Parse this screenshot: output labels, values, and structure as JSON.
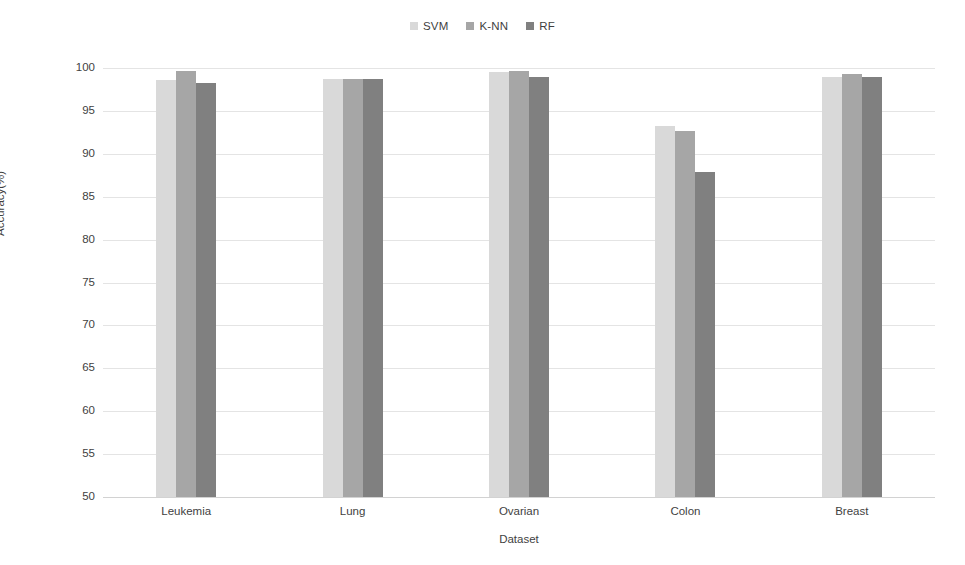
{
  "chart_data": {
    "type": "bar",
    "title": "",
    "subtitle": "",
    "xlabel": "Dataset",
    "ylabel": "Accuracy(%)",
    "categories": [
      "Leukemia",
      "Lung",
      "Ovarian",
      "Colon",
      "Breast"
    ],
    "series": [
      {
        "name": "SVM",
        "color": "#d9d9d9",
        "values": [
          98.6,
          98.7,
          99.5,
          93.2,
          99.0
        ]
      },
      {
        "name": "K-NN",
        "color": "#a6a6a6",
        "values": [
          99.6,
          98.7,
          99.6,
          92.7,
          99.3
        ]
      },
      {
        "name": "RF",
        "color": "#808080",
        "values": [
          98.3,
          98.7,
          99.0,
          87.9,
          98.9
        ]
      }
    ],
    "ylim": [
      50,
      100
    ],
    "ytick_step": 5,
    "yticks": [
      100,
      95,
      90,
      85,
      80,
      75,
      70,
      65,
      60,
      55,
      50
    ],
    "grid": true,
    "legend_position": "top-center"
  },
  "legend": {
    "items": [
      {
        "label": "SVM",
        "color": "#d9d9d9"
      },
      {
        "label": "K-NN",
        "color": "#a6a6a6"
      },
      {
        "label": "RF",
        "color": "#808080"
      }
    ]
  },
  "axes": {
    "y_title": "Accuracy(%)",
    "x_title": "Dataset"
  },
  "colors": {
    "background": "#ffffff",
    "gridline": "#e4e4e4",
    "text": "#3f3f3f"
  }
}
